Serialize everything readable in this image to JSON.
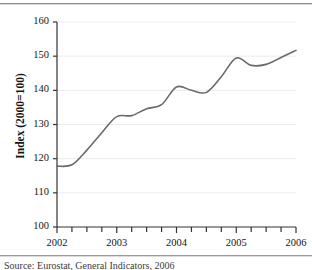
{
  "figure": {
    "name": "index-line-chart",
    "caption": "Source: Eurostat, General Indicators, 2006"
  },
  "axis": {
    "y_title": "Index (2000=100)",
    "y_ticks": [
      "100",
      "110",
      "120",
      "130",
      "140",
      "150",
      "160"
    ],
    "x_ticks": [
      "2002",
      "2003",
      "2004",
      "2005",
      "2006"
    ]
  },
  "colors": {
    "line": "#6a6a6a",
    "grid": "#ebebeb",
    "axis": "#333333",
    "text": "#151515"
  },
  "chart_data": {
    "type": "line",
    "title": "",
    "xlabel": "",
    "ylabel": "Index (2000=100)",
    "xlim": [
      2002,
      2006
    ],
    "ylim": [
      100,
      160
    ],
    "ytick_values": [
      100,
      110,
      120,
      130,
      140,
      150,
      160
    ],
    "xtick_values": [
      2002,
      2003,
      2004,
      2005,
      2006
    ],
    "minor_ticks_per_year": 4,
    "grid": true,
    "legend": "none",
    "x": [
      2002.0,
      2002.25,
      2002.5,
      2002.75,
      2003.0,
      2003.25,
      2003.5,
      2003.75,
      2004.0,
      2004.25,
      2004.5,
      2004.75,
      2005.0,
      2005.25,
      2005.5,
      2005.75,
      2006.0
    ],
    "series": [
      {
        "name": "Index (2000=100)",
        "values": [
          117.8,
          118.2,
          122.5,
          127.6,
          132.3,
          132.6,
          134.6,
          135.8,
          141.0,
          140.0,
          139.4,
          144.0,
          149.5,
          147.3,
          147.6,
          149.6,
          151.7
        ]
      }
    ]
  }
}
